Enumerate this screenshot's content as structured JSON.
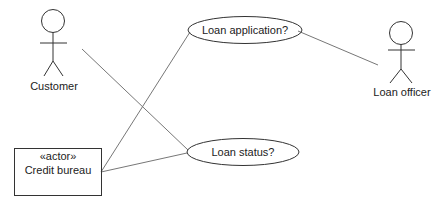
{
  "diagram": {
    "type": "uml-use-case",
    "actors": [
      {
        "id": "customer",
        "label": "Customer",
        "kind": "stick-figure"
      },
      {
        "id": "loan_officer",
        "label": "Loan officer",
        "kind": "stick-figure"
      },
      {
        "id": "credit_bureau",
        "label": "Credit bureau",
        "stereotype": "«actor»",
        "kind": "box"
      }
    ],
    "use_cases": [
      {
        "id": "loan_application",
        "label": "Loan application?"
      },
      {
        "id": "loan_status",
        "label": "Loan status?"
      }
    ],
    "associations": [
      {
        "from": "customer",
        "to": "loan_status"
      },
      {
        "from": "credit_bureau",
        "to": "loan_application"
      },
      {
        "from": "credit_bureau",
        "to": "loan_status"
      },
      {
        "from": "loan_application",
        "to": "loan_officer"
      }
    ],
    "colors": {
      "line": "#333333",
      "connector": "#777777",
      "background": "#ffffff"
    }
  }
}
